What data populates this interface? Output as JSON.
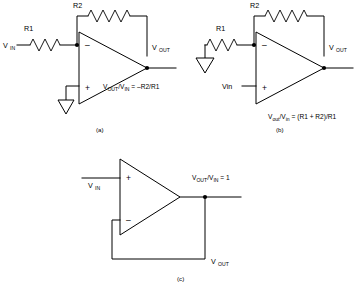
{
  "figure": {
    "background": "#ffffff",
    "line_color": "#000000"
  },
  "circuits": [
    {
      "id": "a",
      "caption": "(a)",
      "name": "inverting-amplifier",
      "input_label": "V",
      "input_sub": "IN",
      "output_label": "V",
      "output_sub": "OUT",
      "resistor_input": "R1",
      "resistor_feedback": "R2",
      "plus_sign": "+",
      "minus_sign": "–",
      "equation": "V",
      "equation_sub1": "OUT",
      "equation_mid": "/V",
      "equation_sub2": "IN",
      "equation_tail": " = –R2/R1",
      "ground": "ground-symbol"
    },
    {
      "id": "b",
      "caption": "(b)",
      "name": "non-inverting-amplifier",
      "input_label": "Vin",
      "output_label": "V",
      "output_sub": "OUT",
      "resistor_input": "R1",
      "resistor_feedback": "R2",
      "plus_sign": "+",
      "minus_sign": "–",
      "equation": "V",
      "equation_sub1": "out",
      "equation_mid": "/V",
      "equation_sub2": "in",
      "equation_tail": " = (R1 + R2)/R1",
      "ground": "ground-symbol"
    },
    {
      "id": "c",
      "caption": "(c)",
      "name": "voltage-follower",
      "input_label": "V",
      "input_sub": "IN",
      "output_label": "V",
      "output_sub": "OUT",
      "plus_sign": "+",
      "minus_sign": "–",
      "equation": "V",
      "equation_sub1": "OUT",
      "equation_mid": "/V",
      "equation_sub2": "IN",
      "equation_tail": " = 1"
    }
  ]
}
